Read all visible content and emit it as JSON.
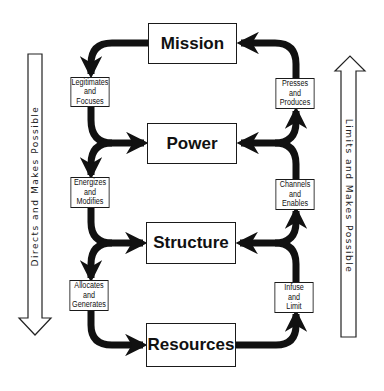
{
  "diagram": {
    "main_boxes": {
      "mission": "Mission",
      "power": "Power",
      "structure": "Structure",
      "resources": "Resources"
    },
    "left_labels": {
      "mission_power": [
        "Legitimates",
        "and",
        "Focuses"
      ],
      "power_structure": [
        "Energizes",
        "and",
        "Modifies"
      ],
      "structure_resources": [
        "Allocates",
        "and",
        "Generates"
      ]
    },
    "right_labels": {
      "power_mission": [
        "Presses",
        "and",
        "Produces"
      ],
      "structure_power": [
        "Channels",
        "and",
        "Enables"
      ],
      "resources_structure": [
        "Infuse",
        "and",
        "Limit"
      ]
    },
    "side_arrows": {
      "left_down": "Directs and Makes Possible",
      "right_up": "Limits and Makes Possible"
    },
    "colors": {
      "line": "#111111",
      "background": "#ffffff"
    }
  }
}
